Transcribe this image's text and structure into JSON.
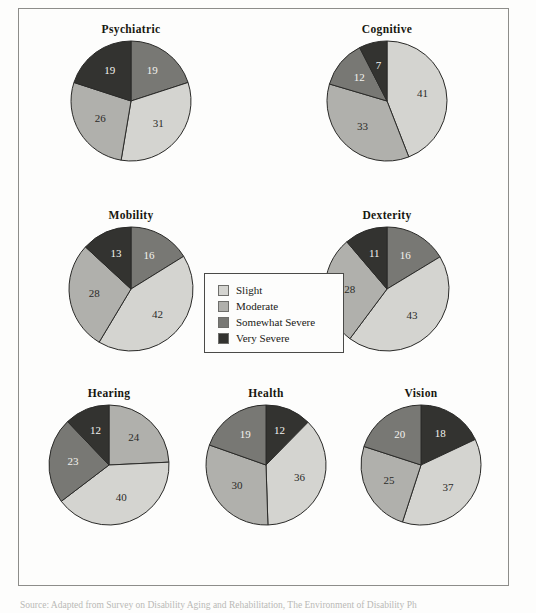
{
  "figure": {
    "frame_border_color": "#8d8d8a",
    "background": "#fdfdfc",
    "caption": "Source: Adapted from Survey on Disability Aging and Rehabilitation, The Environment of Disability Ph"
  },
  "legend": {
    "title": "",
    "position": "center",
    "items": [
      {
        "label": "Slight",
        "color": "#d4d4d0"
      },
      {
        "label": "Moderate",
        "color": "#b0b0ac"
      },
      {
        "label": "Somewhat Severe",
        "color": "#787874"
      },
      {
        "label": "Very Severe",
        "color": "#333330"
      }
    ]
  },
  "palette": {
    "slight": "#d4d4d0",
    "moderate": "#b0b0ac",
    "somewhat_severe": "#787874",
    "very_severe": "#333330",
    "slice_stroke": "#2a2a28",
    "label_light": "#f2f2ee",
    "label_dark": "#2b2b28"
  },
  "chart_data": [
    {
      "type": "pie",
      "title": "Psychiatric",
      "categories": [
        "Somewhat Severe",
        "Slight",
        "Moderate",
        "Very Severe"
      ],
      "values": [
        19,
        31,
        26,
        19
      ],
      "labels": [
        "19",
        "31",
        "26",
        "19"
      ],
      "start_angle": 0,
      "direction": "clockwise"
    },
    {
      "type": "pie",
      "title": "Cognitive",
      "categories": [
        "Slight",
        "Moderate",
        "Somewhat Severe",
        "Very Severe"
      ],
      "values": [
        41,
        33,
        12,
        7
      ],
      "labels": [
        "41",
        "33",
        "12",
        "7"
      ],
      "start_angle": 0,
      "direction": "clockwise"
    },
    {
      "type": "pie",
      "title": "Mobility",
      "categories": [
        "Somewhat Severe",
        "Slight",
        "Moderate",
        "Very Severe"
      ],
      "values": [
        16,
        42,
        28,
        13
      ],
      "labels": [
        "16",
        "42",
        "28",
        "13"
      ],
      "start_angle": 0,
      "direction": "clockwise"
    },
    {
      "type": "pie",
      "title": "Dexterity",
      "categories": [
        "Somewhat Severe",
        "Slight",
        "Moderate",
        "Very Severe"
      ],
      "values": [
        16,
        43,
        28,
        11
      ],
      "labels": [
        "16",
        "43",
        "28",
        "11"
      ],
      "start_angle": 0,
      "direction": "clockwise"
    },
    {
      "type": "pie",
      "title": "Hearing",
      "categories": [
        "Moderate",
        "Slight",
        "Somewhat Severe",
        "Very Severe"
      ],
      "values": [
        24,
        40,
        23,
        12
      ],
      "labels": [
        "24",
        "40",
        "23",
        "12"
      ],
      "start_angle": 0,
      "direction": "clockwise"
    },
    {
      "type": "pie",
      "title": "Health",
      "categories": [
        "Very Severe",
        "Slight",
        "Moderate",
        "Somewhat Severe"
      ],
      "values": [
        12,
        36,
        30,
        19
      ],
      "labels": [
        "12",
        "36",
        "30",
        "19"
      ],
      "start_angle": 0,
      "direction": "clockwise"
    },
    {
      "type": "pie",
      "title": "Vision",
      "categories": [
        "Very Severe",
        "Slight",
        "Moderate",
        "Somewhat Severe"
      ],
      "values": [
        18,
        37,
        25,
        20
      ],
      "labels": [
        "18",
        "37",
        "25",
        "20"
      ],
      "start_angle": 0,
      "direction": "clockwise"
    }
  ],
  "layout": {
    "cells": [
      {
        "chart": 0,
        "left": 22,
        "top": 14,
        "width": 180,
        "radius": 60
      },
      {
        "chart": 1,
        "left": 278,
        "top": 14,
        "width": 180,
        "radius": 60
      },
      {
        "chart": 2,
        "left": 22,
        "top": 200,
        "width": 180,
        "radius": 62
      },
      {
        "chart": 3,
        "left": 278,
        "top": 200,
        "width": 180,
        "radius": 62
      },
      {
        "chart": 4,
        "left": 10,
        "top": 378,
        "width": 160,
        "radius": 60
      },
      {
        "chart": 5,
        "left": 167,
        "top": 378,
        "width": 160,
        "radius": 60
      },
      {
        "chart": 6,
        "left": 322,
        "top": 378,
        "width": 160,
        "radius": 60
      }
    ]
  }
}
